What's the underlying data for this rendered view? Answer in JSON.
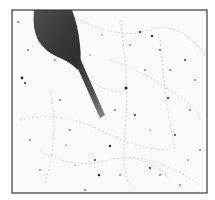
{
  "image": {
    "description": "Photograph of a hand holding a tool over a star chart with scattered dots and faint constellation lines, framed by a thin dark border",
    "colors": {
      "background": "#ffffff",
      "frame": "#3a3a3a",
      "hand": "#3c3c3c",
      "tool": "#2a2a2a",
      "stars": "#222222",
      "lines": "#c8c8c8"
    }
  }
}
